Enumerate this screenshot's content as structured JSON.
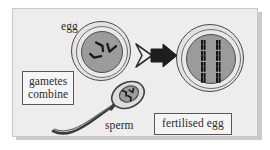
{
  "figure": {
    "name": "fertilisation-diagram",
    "caption_text": "gametes combine to form a fertilised egg",
    "background_color": "#eeecec",
    "ink_color": "#2b2b2b",
    "cell_fill_color": "#9b9b9b",
    "coat_fill_color": "#e4e2e2"
  },
  "labels": {
    "egg": "egg",
    "sperm": "sperm",
    "gametes_combine_line1": "gametes",
    "gametes_combine_line2": "combine",
    "fertilised_egg": "fertilised egg"
  },
  "cells": {
    "egg": {
      "name": "egg-cell",
      "chromosome_count": 3,
      "chromosome_style": "single",
      "chromosomes": [
        {
          "id": "egg-chromosome-1",
          "x": 13,
          "y": 6,
          "rotate": -28
        },
        {
          "id": "egg-chromosome-2",
          "x": 23,
          "y": 10,
          "rotate": 18
        },
        {
          "id": "egg-chromosome-3",
          "x": 8,
          "y": 19,
          "rotate": 118
        }
      ]
    },
    "fertilised_egg": {
      "name": "fertilised-egg-cell",
      "chromosome_count": 8,
      "chromosome_style": "paired",
      "chromosomes": [
        {
          "id": "zygote-chromosome-1",
          "x": 14,
          "y": 7
        },
        {
          "id": "zygote-chromosome-2",
          "x": 29,
          "y": 7
        },
        {
          "id": "zygote-chromosome-3",
          "x": 14,
          "y": 18
        },
        {
          "id": "zygote-chromosome-4",
          "x": 29,
          "y": 18
        },
        {
          "id": "zygote-chromosome-5",
          "x": 14,
          "y": 29
        },
        {
          "id": "zygote-chromosome-6",
          "x": 29,
          "y": 29
        },
        {
          "id": "zygote-chromosome-7",
          "x": 14,
          "y": 39
        },
        {
          "id": "zygote-chromosome-8",
          "x": 29,
          "y": 39
        }
      ]
    },
    "sperm": {
      "name": "sperm-cell",
      "chromosome_count": 3,
      "chromosome_style": "single"
    }
  },
  "arrow": {
    "name": "fertilisation-arrow",
    "direction": "right",
    "style": "outline-plus-solid"
  }
}
